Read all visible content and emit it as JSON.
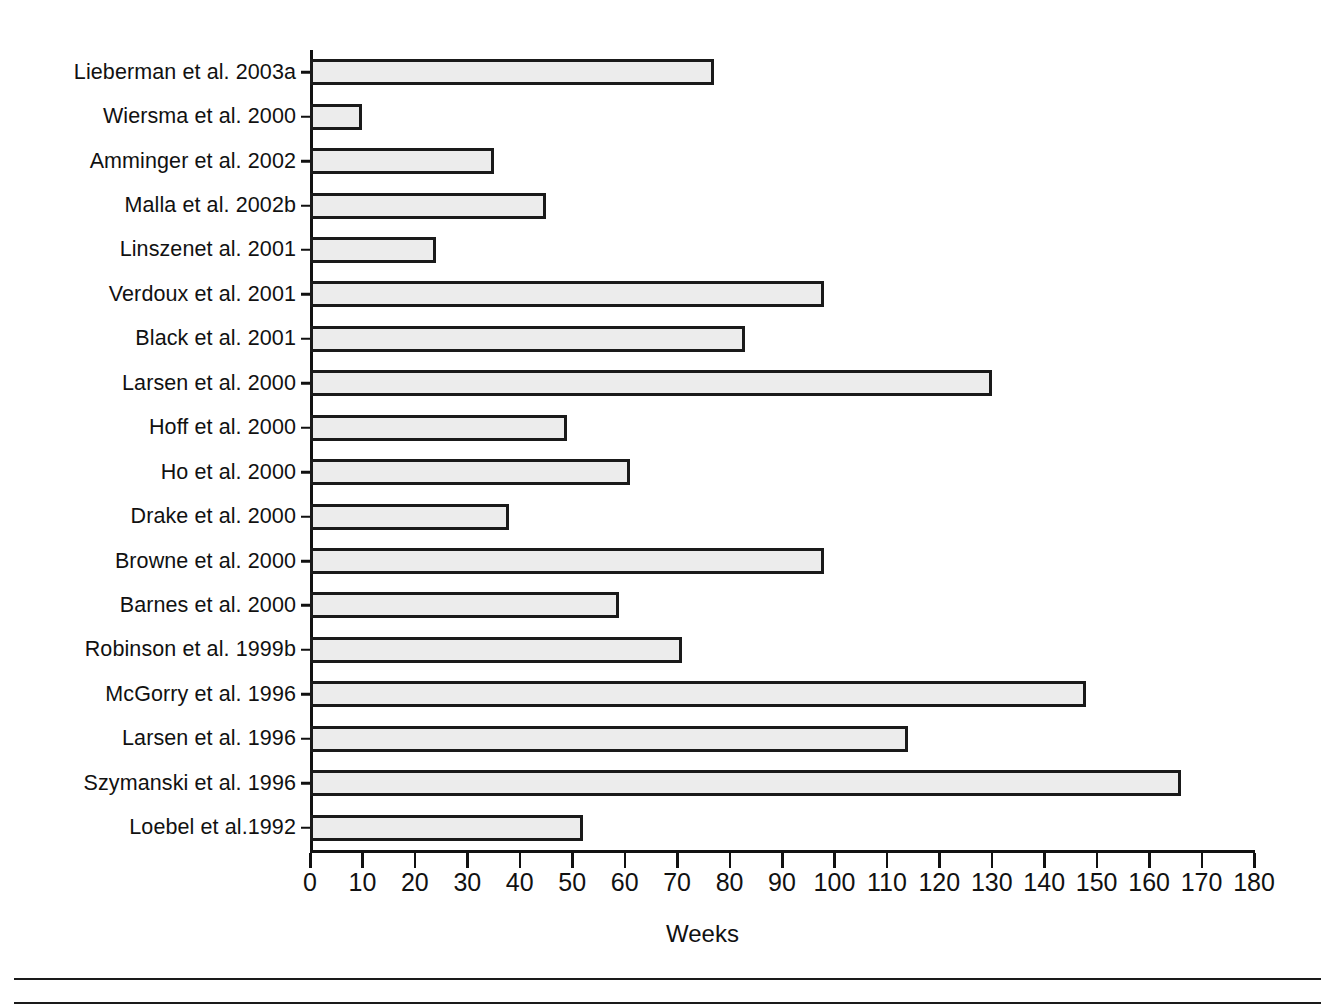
{
  "chart_data": {
    "type": "bar",
    "orientation": "horizontal",
    "title": "",
    "xlabel": "Weeks",
    "ylabel": "",
    "xlim": [
      0,
      180
    ],
    "xticks": [
      0,
      10,
      20,
      30,
      40,
      50,
      60,
      70,
      80,
      90,
      100,
      110,
      120,
      130,
      140,
      150,
      160,
      170,
      180
    ],
    "grid": false,
    "legend": null,
    "bar_fill_color": "#ececec",
    "bar_edge_color": "#1a1a1a",
    "categories": [
      "Lieberman et al. 2003a",
      "Wiersma et al. 2000",
      "Amminger et al. 2002",
      "Malla et al. 2002b",
      "Linszenet al. 2001",
      "Verdoux et al. 2001",
      "Black et al. 2001",
      "Larsen et al. 2000",
      "Hoff et al. 2000",
      "Ho et al. 2000",
      "Drake et al. 2000",
      "Browne et al. 2000",
      "Barnes et al. 2000",
      "Robinson et al. 1999b",
      "McGorry et al. 1996",
      "Larsen et al. 1996",
      "Szymanski et al. 1996",
      "Loebel et al.1992"
    ],
    "values": [
      77,
      10,
      35,
      45,
      24,
      98,
      83,
      130,
      49,
      61,
      38,
      98,
      59,
      71,
      148,
      114,
      166,
      52
    ]
  }
}
